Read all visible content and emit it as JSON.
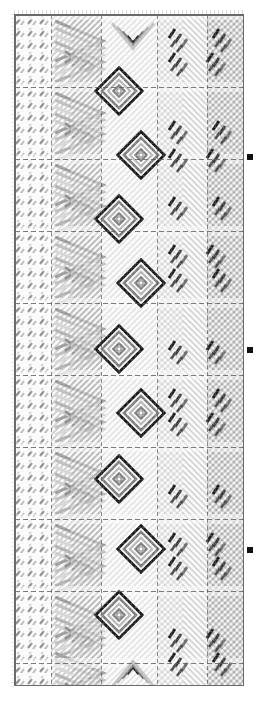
{
  "document": {
    "kind": "weaving-draft-chart",
    "title": "Woven Pattern Draft",
    "canvas": {
      "width": 260,
      "height": 702
    },
    "background_color": "#ffffff"
  },
  "chart_area": {
    "x": 14,
    "y": 14,
    "width": 230,
    "height": 672,
    "border_color": "#6a6a6a",
    "fill_color": "#fdfdfd"
  },
  "palette": {
    "background": "#ffffff",
    "paper": "#fdfdfd",
    "grid_fine": "#e2e2e2",
    "grid_section": "#555555",
    "ink_dark": "#1a1a1a",
    "ink_mid": "#8c8c8c",
    "ink_light": "#c4c4c4",
    "ink_pale": "#dedede",
    "marker": "#111111"
  },
  "grid": {
    "cell_size": 4,
    "columns": 57,
    "rows": 168,
    "section_interval_rows": 18,
    "section_interval_cols": 18,
    "section_rows_y": [
      14,
      86,
      158,
      230,
      302,
      374,
      446,
      518,
      590,
      662
    ],
    "section_cols_x": [
      14,
      50,
      100,
      156,
      206,
      244
    ]
  },
  "columns": [
    {
      "id": "col-left-slashes",
      "label": "Left border repeat",
      "x": 14,
      "width": 36,
      "motif": "short-slash-repeat",
      "tone": "#8c8c8c",
      "repeat_height": 12
    },
    {
      "id": "col-chevrons",
      "label": "Chevron field",
      "x": 50,
      "width": 50,
      "motif": "nested-chevrons",
      "tone": "#9a9a9a",
      "repeat_height": 72
    },
    {
      "id": "col-diamonds",
      "label": "Diamond medallion column",
      "x": 100,
      "width": 56,
      "motif": "concentric-diamond",
      "tone": "#1a1a1a",
      "repeat_height": 72
    },
    {
      "id": "col-dashes",
      "label": "Dash cluster column",
      "x": 156,
      "width": 50,
      "motif": "diagonal-dash-cluster",
      "tone": "#2a2a2a",
      "repeat_height": 72
    },
    {
      "id": "col-right-twill",
      "label": "Right twill field",
      "x": 206,
      "width": 38,
      "motif": "diagonal-twill",
      "tone": "#b0b0b0",
      "repeat_height": 72
    }
  ],
  "motifs": {
    "diamond": {
      "name": "concentric-diamond",
      "ring_count": 4,
      "size": 46,
      "ring_colors": [
        "#1a1a1a",
        "#ffffff",
        "#7d7d7d",
        "#ffffff",
        "#b8b8b8"
      ],
      "positions": [
        {
          "cx": 118,
          "cy": 90
        },
        {
          "cx": 140,
          "cy": 154
        },
        {
          "cx": 118,
          "cy": 218
        },
        {
          "cx": 140,
          "cy": 282
        },
        {
          "cx": 118,
          "cy": 348
        },
        {
          "cx": 140,
          "cy": 412
        },
        {
          "cx": 118,
          "cy": 478
        },
        {
          "cx": 140,
          "cy": 548
        },
        {
          "cx": 118,
          "cy": 614
        }
      ]
    },
    "chevron": {
      "name": "nested-chevrons",
      "direction": "right",
      "band_count": 5,
      "positions_y": [
        40,
        112,
        184,
        256,
        328,
        400,
        472,
        544,
        616,
        672
      ]
    },
    "apex_chevron": {
      "name": "apex-chevron",
      "direction": "down",
      "positions": [
        {
          "cx": 132,
          "cy": 40
        },
        {
          "cx": 132,
          "cy": 668
        }
      ]
    },
    "dash_cluster": {
      "name": "diagonal-dash-cluster",
      "dash_length": 9,
      "angle_deg": 55,
      "positions": [
        {
          "x": 168,
          "y": 28
        },
        {
          "x": 212,
          "y": 28
        },
        {
          "x": 168,
          "y": 52
        },
        {
          "x": 206,
          "y": 52
        },
        {
          "x": 168,
          "y": 120
        },
        {
          "x": 212,
          "y": 120
        },
        {
          "x": 168,
          "y": 148
        },
        {
          "x": 206,
          "y": 148
        },
        {
          "x": 168,
          "y": 196
        },
        {
          "x": 212,
          "y": 196
        },
        {
          "x": 168,
          "y": 244
        },
        {
          "x": 206,
          "y": 244
        },
        {
          "x": 168,
          "y": 268
        },
        {
          "x": 212,
          "y": 268
        },
        {
          "x": 168,
          "y": 340
        },
        {
          "x": 206,
          "y": 340
        },
        {
          "x": 168,
          "y": 388
        },
        {
          "x": 212,
          "y": 388
        },
        {
          "x": 168,
          "y": 412
        },
        {
          "x": 206,
          "y": 412
        },
        {
          "x": 168,
          "y": 484
        },
        {
          "x": 212,
          "y": 484
        },
        {
          "x": 168,
          "y": 532
        },
        {
          "x": 206,
          "y": 532
        },
        {
          "x": 168,
          "y": 556
        },
        {
          "x": 212,
          "y": 556
        },
        {
          "x": 168,
          "y": 628
        },
        {
          "x": 206,
          "y": 628
        },
        {
          "x": 168,
          "y": 652
        },
        {
          "x": 212,
          "y": 652
        }
      ]
    }
  },
  "edge_markers": [
    {
      "id": "marker-1",
      "x": 247,
      "y": 154,
      "size": 6,
      "color": "#111111"
    },
    {
      "id": "marker-2",
      "x": 247,
      "y": 347,
      "size": 6,
      "color": "#111111"
    },
    {
      "id": "marker-3",
      "x": 247,
      "y": 547,
      "size": 6,
      "color": "#111111"
    }
  ],
  "margin_ticks": {
    "top": {
      "count": 57,
      "spacing": 4,
      "y": 14,
      "length": 4,
      "color": "#c8c8c8"
    },
    "left": {
      "count": 168,
      "spacing": 4,
      "x": 14,
      "length": 3,
      "color": "#d6d6d6"
    }
  }
}
